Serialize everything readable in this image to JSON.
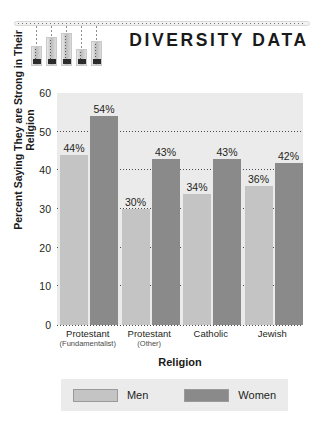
{
  "header": {
    "title": "DIVERSITY DATA",
    "decoration": {
      "name": "hanging-bars-ornament",
      "bars": [
        {
          "height": 20,
          "string": 20
        },
        {
          "height": 29,
          "string": 11
        },
        {
          "height": 33,
          "string": 7
        },
        {
          "height": 17,
          "string": 23
        },
        {
          "height": 25,
          "string": 15
        }
      ]
    }
  },
  "chart_data": {
    "type": "bar",
    "title": "DIVERSITY DATA",
    "xlabel": "Religion",
    "ylabel": "Percent Saying They are Strong in Their Religion",
    "ylim": [
      0,
      60
    ],
    "yticks": [
      0,
      10,
      20,
      30,
      40,
      50,
      60
    ],
    "grid": true,
    "legend_position": "bottom",
    "categories": [
      "Protestant (Fundamentalist)",
      "Protestant (Other)",
      "Catholic",
      "Jewish"
    ],
    "category_labels": [
      {
        "main": "Protestant",
        "sub": "(Fundamentalist)"
      },
      {
        "main": "Protestant",
        "sub": "(Other)"
      },
      {
        "main": "Catholic",
        "sub": ""
      },
      {
        "main": "Jewish",
        "sub": ""
      }
    ],
    "series": [
      {
        "name": "Men",
        "color": "#c4c4c4",
        "values": [
          44,
          30,
          34,
          36
        ],
        "labels": [
          "44%",
          "30%",
          "34%",
          "36%"
        ]
      },
      {
        "name": "Women",
        "color": "#8a8a8a",
        "values": [
          54,
          43,
          43,
          42
        ],
        "labels": [
          "54%",
          "43%",
          "43%",
          "42%"
        ]
      }
    ]
  },
  "legend": {
    "entries": [
      {
        "label": "Men",
        "color": "#c4c4c4"
      },
      {
        "label": "Women",
        "color": "#8a8a8a"
      }
    ]
  }
}
